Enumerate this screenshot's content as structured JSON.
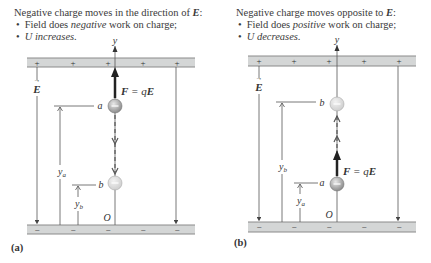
{
  "panel_a": {
    "label": "(a)",
    "caption_title_prefix": "Negative charge moves in the direction of ",
    "caption_title_vec": "E",
    "caption_title_suffix": ":",
    "bullet1_pre": "Field does ",
    "bullet1_em": "negative",
    "bullet1_post": " work on charge;",
    "bullet2": "U increases.",
    "axis_label": "y",
    "origin_label": "O",
    "field_label": "E",
    "force_label_F": "F",
    "force_label_eq": " = q",
    "force_label_E": "E",
    "point_a": "a",
    "point_b": "b",
    "height_a": "y",
    "height_a_sub": "a",
    "height_b": "y",
    "height_b_sub": "b",
    "top_plate_signs": [
      "+",
      "+",
      "+",
      "+",
      "+"
    ],
    "bottom_plate_signs": [
      "−",
      "−",
      "−",
      "−",
      "−"
    ]
  },
  "panel_b": {
    "label": "(b)",
    "caption_title_prefix": "Negative charge moves opposite to ",
    "caption_title_vec": "E",
    "caption_title_suffix": ":",
    "bullet1_pre": "Field does ",
    "bullet1_em": "positive",
    "bullet1_post": " work on charge;",
    "bullet2": "U decreases.",
    "axis_label": "y",
    "origin_label": "O",
    "field_label": "E",
    "force_label_F": "F",
    "force_label_eq": " = q",
    "force_label_E": "E",
    "point_a": "a",
    "point_b": "b",
    "height_a": "y",
    "height_a_sub": "a",
    "height_b": "y",
    "height_b_sub": "b",
    "top_plate_signs": [
      "+",
      "+",
      "+",
      "+",
      "+"
    ],
    "bottom_plate_signs": [
      "−",
      "−",
      "−",
      "−",
      "−"
    ]
  },
  "colors": {
    "plate_fill": "#d4d6d6",
    "plate_edge": "#8a8a8a",
    "line": "#555555",
    "charge_fill": "#b0b0b0",
    "charge_ghost": "#dcdcdc",
    "arrow": "#222222"
  }
}
